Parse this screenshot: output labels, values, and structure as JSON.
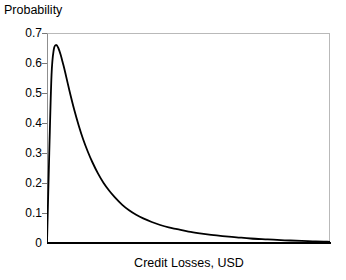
{
  "chart_data": {
    "type": "line",
    "title": "",
    "xlabel": "Credit Losses, USD",
    "ylabel": "Probability",
    "grid": false,
    "legend": false,
    "legend_position": "none",
    "xlim": [
      0,
      1
    ],
    "ylim": [
      0,
      0.7
    ],
    "x_tick_labels": [],
    "y_tick_labels": [
      "0.7",
      "0.6",
      "0.5",
      "0.4",
      "0.3",
      "0.2",
      "0.1",
      "0"
    ],
    "y_ticks": [
      0.7,
      0.6,
      0.5,
      0.4,
      0.3,
      0.2,
      0.1,
      0
    ],
    "series": [
      {
        "name": "Credit loss probability density",
        "color": "#000000",
        "line_width": 1.8,
        "x": [
          0.0,
          0.008,
          0.016,
          0.024,
          0.032,
          0.04,
          0.048,
          0.056,
          0.064,
          0.08,
          0.096,
          0.112,
          0.128,
          0.144,
          0.16,
          0.18,
          0.2,
          0.22,
          0.24,
          0.265,
          0.29,
          0.315,
          0.34,
          0.37,
          0.4,
          0.43,
          0.46,
          0.5,
          0.54,
          0.58,
          0.62,
          0.67,
          0.72,
          0.78,
          0.84,
          0.9,
          0.95,
          1.0
        ],
        "y": [
          0.0,
          0.3,
          0.56,
          0.645,
          0.66,
          0.65,
          0.628,
          0.6,
          0.57,
          0.505,
          0.445,
          0.392,
          0.345,
          0.305,
          0.27,
          0.232,
          0.2,
          0.174,
          0.152,
          0.128,
          0.109,
          0.094,
          0.082,
          0.07,
          0.06,
          0.052,
          0.046,
          0.038,
          0.032,
          0.027,
          0.023,
          0.019,
          0.015,
          0.012,
          0.009,
          0.007,
          0.005,
          0.004
        ]
      }
    ],
    "peak": {
      "value": 0.66,
      "label": "peak probability"
    }
  },
  "axes": {
    "y_title": "Probability",
    "x_title": "Credit Losses, USD"
  },
  "colors": {
    "curve": "#000000",
    "axis": "#000000",
    "frame": "#b9b9b9",
    "background": "#ffffff",
    "tick": "#777777"
  }
}
